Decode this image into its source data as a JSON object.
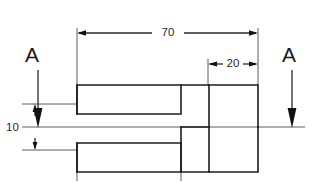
{
  "drawing": {
    "type": "engineering-section-drawing",
    "title": "Stepped shaft cross-section with section A-A cutting plane",
    "background_color": "#ffffff",
    "line_color": "#1d1d1d",
    "thin_line_color": "#4a4a4a",
    "dimensions": [
      {
        "id": "overall-length",
        "value": "70",
        "orientation": "horizontal",
        "position": "above-part",
        "from_x": 77,
        "to_x": 258,
        "line_y": 33,
        "text_x": 168,
        "text_y": 33
      },
      {
        "id": "step-length",
        "value": "20",
        "orientation": "horizontal",
        "position": "above-right-step",
        "from_x": 208,
        "to_x": 258,
        "line_y": 64,
        "text_x": 233,
        "text_y": 64
      },
      {
        "id": "bore-height",
        "value": "10",
        "orientation": "vertical",
        "position": "left-of-part",
        "from_y": 104,
        "to_y": 150,
        "line_x": 35,
        "text_x": 20,
        "text_y": 127
      }
    ],
    "section_marks": [
      {
        "id": "section-a-left",
        "label": "A",
        "label_x": 32,
        "label_y": 56,
        "arrow_x": 38,
        "arrow_from_y": 70,
        "arrow_to_y": 127,
        "direction": "down"
      },
      {
        "id": "section-a-right",
        "label": "A",
        "label_x": 289,
        "label_y": 56,
        "arrow_x": 292,
        "arrow_from_y": 70,
        "arrow_to_y": 127,
        "direction": "down"
      }
    ],
    "geometry": {
      "body_left_x": 77,
      "body_right_x": 258,
      "body_top_y": 85,
      "body_bottom_y": 172,
      "neck_left_x": 181,
      "neck_right_x": 209,
      "neck_top_y": 85,
      "neck_bottom_y": 172,
      "bore_top_y": 114,
      "bore_bottom_y": 143,
      "bore_end_x": 181,
      "centerline_y": 127,
      "centerline_from_x": 22,
      "centerline_to_x": 305
    }
  }
}
